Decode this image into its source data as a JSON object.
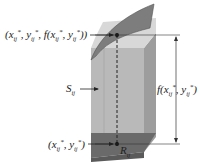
{
  "diagram": {
    "type": "3d-column-under-surface",
    "labels": {
      "top_point": "(x_ij*, y_ij*, f(x_ij*, y_ij*))",
      "base_point": "(x_ij*, y_ij*)",
      "surface_patch": "S_ij",
      "region": "R_ij",
      "height": "f(x_ij*, y_ij*)"
    },
    "colors": {
      "column_front": "#b9b9b9",
      "column_side": "#9d9d9d",
      "column_top_band": "#d6d6d6",
      "surface": "#7d7d7d",
      "base": "#6a6a6a",
      "lines": "#333333"
    }
  }
}
